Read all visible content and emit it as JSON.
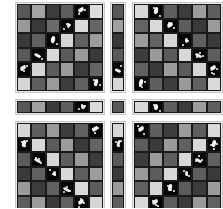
{
  "figure": {
    "blocks": [
      {
        "id": "top-left",
        "x": 15,
        "y": 2,
        "w": 90,
        "h": 91,
        "rows": 6,
        "cols": 6,
        "cells": [
          [
            "#585858",
            "#a4a4a4",
            "#3c3c3c",
            "#5e5e5e",
            "K1",
            "#dcdcdc"
          ],
          [
            "#9a9a9a",
            "#3a3a3a",
            "#6a6a6a",
            "K4",
            "#dadada",
            "#666666"
          ],
          [
            "#3a3a3a",
            "#606060",
            "K2",
            "#d6d6d6",
            "#606060",
            "#9c9c9c"
          ],
          [
            "#585858",
            "K3",
            "#d8d8d8",
            "#5a5a5a",
            "#9a9a9a",
            "#3a3a3a"
          ],
          [
            "K1",
            "#d4d4d4",
            "#5c5c5c",
            "#9c9c9c",
            "#3c3c3c",
            "#646464"
          ],
          [
            "#d6d6d6",
            "#5e5e5e",
            "#9a9a9a",
            "#3c3c3c",
            "#606060",
            "K2"
          ]
        ]
      },
      {
        "id": "top-strip-col",
        "x": 110,
        "y": 2,
        "w": 16,
        "h": 91,
        "rows": 6,
        "cols": 1,
        "cells": [
          [
            "#585858"
          ],
          [
            "#a0a0a0"
          ],
          [
            "#3a3a3a"
          ],
          [
            "#5a5a5a"
          ],
          [
            "K3"
          ],
          [
            "#d6d6d6"
          ]
        ]
      },
      {
        "id": "top-right",
        "x": 132,
        "y": 2,
        "w": 91,
        "h": 91,
        "rows": 6,
        "cols": 6,
        "cells": [
          [
            "#d8d8d8",
            "K2",
            "#5e5e5e",
            "#3c3c3c",
            "#9c9c9c",
            "#5e5e5e"
          ],
          [
            "#646464",
            "#dadada",
            "K1",
            "#5c5c5c",
            "#3a3a3a",
            "#9a9a9a"
          ],
          [
            "#9c9c9c",
            "#646464",
            "#d6d6d6",
            "K4",
            "#606060",
            "#3a3a3a"
          ],
          [
            "#3c3c3c",
            "#9a9a9a",
            "#5a5a5a",
            "#d8d8d8",
            "K3",
            "#5e5e5e"
          ],
          [
            "#606060",
            "#3a3a3a",
            "#9c9c9c",
            "#5c5c5c",
            "#d6d6d6",
            "K1"
          ],
          [
            "K2",
            "#5e5e5e",
            "#3c3c3c",
            "#9a9a9a",
            "#606060",
            "#dadada"
          ]
        ]
      },
      {
        "id": "middle-strip-left",
        "x": 15,
        "y": 99,
        "w": 90,
        "h": 16,
        "rows": 1,
        "cols": 6,
        "cells": [
          [
            "#585858",
            "#a0a0a0",
            "#3a3a3a",
            "#5e5e5e",
            "K4",
            "#dadada"
          ]
        ]
      },
      {
        "id": "middle-strip-center",
        "x": 110,
        "y": 99,
        "w": 16,
        "h": 16,
        "rows": 1,
        "cols": 1,
        "cells": [
          [
            "#585858"
          ]
        ]
      },
      {
        "id": "middle-strip-right",
        "x": 132,
        "y": 99,
        "w": 91,
        "h": 16,
        "rows": 1,
        "cols": 6,
        "cells": [
          [
            "#d8d8d8",
            "K2",
            "#5e5e5e",
            "#3c3c3c",
            "#9c9c9c",
            "#5e5e5e"
          ]
        ]
      },
      {
        "id": "bottom-left",
        "x": 15,
        "y": 121,
        "w": 90,
        "h": 91,
        "rows": 6,
        "cols": 6,
        "cells": [
          [
            "#d6d6d6",
            "#5e5e5e",
            "#9a9a9a",
            "#3c3c3c",
            "#606060",
            "K1"
          ],
          [
            "K2",
            "#d8d8d8",
            "#5c5c5c",
            "#9c9c9c",
            "#3a3a3a",
            "#646464"
          ],
          [
            "#5a5a5a",
            "K3",
            "#d6d6d6",
            "#5e5e5e",
            "#9a9a9a",
            "#3c3c3c"
          ],
          [
            "#3a3a3a",
            "#606060",
            "K4",
            "#d8d8d8",
            "#5e5e5e",
            "#9c9c9c"
          ],
          [
            "#9a9a9a",
            "#3c3c3c",
            "#606060",
            "K3",
            "#dadada",
            "#5c5c5c"
          ],
          [
            "#5e5e5e",
            "#9c9c9c",
            "#3a3a3a",
            "#606060",
            "K1",
            "#d6d6d6"
          ]
        ]
      },
      {
        "id": "bottom-strip-col",
        "x": 110,
        "y": 121,
        "w": 16,
        "h": 91,
        "rows": 6,
        "cols": 1,
        "cells": [
          [
            "#d6d6d6"
          ],
          [
            "K2"
          ],
          [
            "#5a5a5a"
          ],
          [
            "#3a3a3a"
          ],
          [
            "#9a9a9a"
          ],
          [
            "#5e5e5e"
          ]
        ]
      },
      {
        "id": "bottom-right",
        "x": 132,
        "y": 121,
        "w": 91,
        "h": 91,
        "rows": 6,
        "cols": 6,
        "cells": [
          [
            "K1",
            "#5e5e5e",
            "#3c3c3c",
            "#9c9c9c",
            "#5e5e5e",
            "#dadada"
          ],
          [
            "#5c5c5c",
            "#3a3a3a",
            "#9a9a9a",
            "#606060",
            "#d8d8d8",
            "K2"
          ],
          [
            "#3c3c3c",
            "#9c9c9c",
            "#5e5e5e",
            "#d6d6d6",
            "K3",
            "#606060"
          ],
          [
            "#9a9a9a",
            "#5c5c5c",
            "#d8d8d8",
            "K4",
            "#5e5e5e",
            "#3a3a3a"
          ],
          [
            "#606060",
            "#d6d6d6",
            "K2",
            "#5c5c5c",
            "#3c3c3c",
            "#9c9c9c"
          ],
          [
            "#dadada",
            "K1",
            "#5e5e5e",
            "#3a3a3a",
            "#9a9a9a",
            "#606060"
          ]
        ]
      }
    ]
  }
}
